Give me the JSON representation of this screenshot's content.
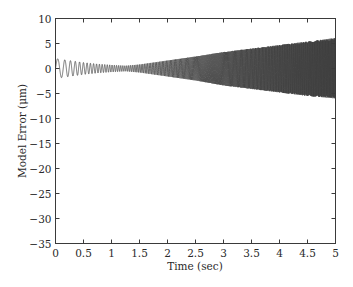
{
  "chart_data": {
    "type": "line",
    "title": "",
    "xlabel": "Time (sec)",
    "ylabel": "Model Error (μm)",
    "xlim": [
      0,
      5
    ],
    "ylim": [
      -35,
      10
    ],
    "xticks": [
      0,
      0.5,
      1,
      1.5,
      2,
      2.5,
      3,
      3.5,
      4,
      4.5,
      5
    ],
    "xtick_labels": [
      "0",
      "0.5",
      "1",
      "1.5",
      "2",
      "2.5",
      "3",
      "3.5",
      "4",
      "4.5",
      "5"
    ],
    "yticks": [
      10,
      5,
      0,
      -5,
      -10,
      -15,
      -20,
      -25,
      -30,
      -35
    ],
    "ytick_labels": [
      "10",
      "5",
      "0",
      "−5",
      "−10",
      "−15",
      "−20",
      "−25",
      "−30",
      "−35"
    ],
    "grid": false,
    "legend": null,
    "series": [
      {
        "name": "Model Error",
        "description": "Oscillating error signal with increasing frequency; amplitude ~2 at start, minimum ~0.5 near t=1.3, then growing to ~6 at t=5",
        "color": "#3a3a3a",
        "envelope": {
          "t": [
            0,
            0.25,
            0.5,
            0.75,
            1.0,
            1.25,
            1.5,
            2.0,
            2.5,
            3.0,
            3.5,
            4.0,
            4.5,
            5.0
          ],
          "upper": [
            2.0,
            1.6,
            1.2,
            0.9,
            0.7,
            0.55,
            0.8,
            1.6,
            2.4,
            3.3,
            4.0,
            4.7,
            5.4,
            6.1
          ],
          "lower": [
            -2.0,
            -1.6,
            -1.2,
            -0.9,
            -0.7,
            -0.55,
            -0.8,
            -1.6,
            -2.4,
            -3.4,
            -4.1,
            -4.8,
            -5.5,
            -6.0
          ]
        }
      }
    ]
  }
}
